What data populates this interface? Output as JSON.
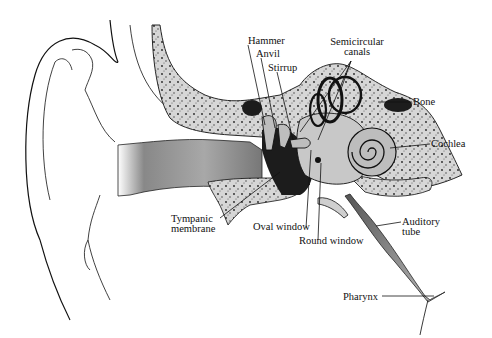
{
  "figure": {
    "labels": {
      "hammer": "Hammer",
      "anvil": "Anvil",
      "stirrup": "Stirrup",
      "semicircular_l1": "Semicircular",
      "semicircular_l2": "canals",
      "bone": "Bone",
      "cochlea": "Cochlea",
      "tympanic_l1": "Tympanic",
      "tympanic_l2": "membrane",
      "oval_window": "Oval window",
      "round_window": "Round window",
      "auditory_l1": "Auditory",
      "auditory_l2": "tube",
      "pharynx": "Pharynx"
    },
    "colors": {
      "ink": "#111111",
      "bone_fill": "#d9d9d9",
      "canal_fill": "#bdbdbd",
      "dark_cavity": "#1a1a1a",
      "background": "#ffffff"
    }
  }
}
